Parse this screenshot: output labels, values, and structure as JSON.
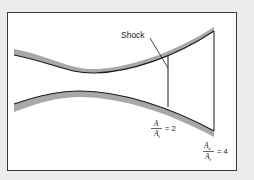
{
  "diagram": {
    "type": "converging-diverging nozzle with normal shock",
    "colors": {
      "background": "#ececec",
      "panel": "#ffffff",
      "wall_shade": "#a8a8a8",
      "line": "#1a1a1a"
    },
    "labels": {
      "shock": "Shock",
      "shock_ratio": {
        "numerator": "A",
        "denominator_main": "A",
        "denominator_sub": "t",
        "equals": "= 2"
      },
      "exit_ratio": {
        "numerator_main": "A",
        "numerator_sub": "e",
        "denominator_main": "A",
        "denominator_sub": "t",
        "equals": "= 4"
      }
    },
    "values": {
      "shock_area_ratio": 2,
      "exit_area_ratio": 4
    }
  }
}
